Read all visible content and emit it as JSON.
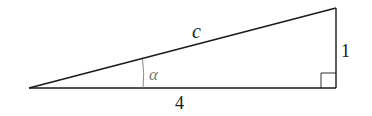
{
  "diagram": {
    "type": "right-triangle",
    "labels": {
      "hypotenuse": "c",
      "adjacent": "4",
      "opposite": "1",
      "angle": "α"
    },
    "colors": {
      "stroke": "#1a1a1a",
      "angle_label": "#7a7a7a",
      "background": "#ffffff"
    }
  }
}
